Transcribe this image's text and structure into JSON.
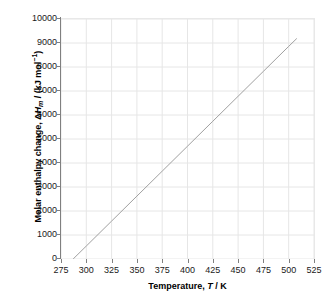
{
  "chart_data": {
    "type": "line",
    "title": "",
    "xlabel": "Temperature, T / K",
    "ylabel": "Molar enthalpy change, ΔHm / (kJ mol⁻¹)",
    "xlabel_parts": {
      "prefix": "Temperature, ",
      "italic": "T",
      "suffix": " / K"
    },
    "ylabel_parts": {
      "prefix": "Molar enthalpy change, Δ",
      "italic": "H",
      "subscript": "m",
      "middle": " / (kJ mol",
      "superscript": "−1",
      "suffix": ")"
    },
    "xlim": [
      275,
      525
    ],
    "ylim": [
      0,
      10000
    ],
    "xticks": [
      275,
      300,
      325,
      350,
      375,
      400,
      425,
      450,
      475,
      500,
      525
    ],
    "yticks": [
      0,
      1000,
      2000,
      3000,
      4000,
      5000,
      6000,
      7000,
      8000,
      9000,
      10000
    ],
    "xtick_labels": [
      "275",
      "300",
      "325",
      "350",
      "375",
      "400",
      "425",
      "450",
      "475",
      "500",
      "525"
    ],
    "ytick_labels": [
      "0",
      "1000",
      "2000",
      "3000",
      "4000",
      "5000",
      "6000",
      "7000",
      "8000",
      "9000",
      "10000"
    ],
    "grid": true,
    "grid_color": "#e6e6e6",
    "legend": false,
    "legend_position": "none",
    "axis_color": "#808080",
    "series": [
      {
        "name": "Molar enthalpy change",
        "color": "#a0a0a0",
        "line_width": 1,
        "x": [
          287,
          300,
          325,
          350,
          375,
          400,
          425,
          450,
          475,
          500,
          508
        ],
        "y": [
          0,
          540,
          1580,
          2620,
          3660,
          4700,
          5740,
          6780,
          7820,
          8860,
          9190
        ]
      }
    ]
  }
}
